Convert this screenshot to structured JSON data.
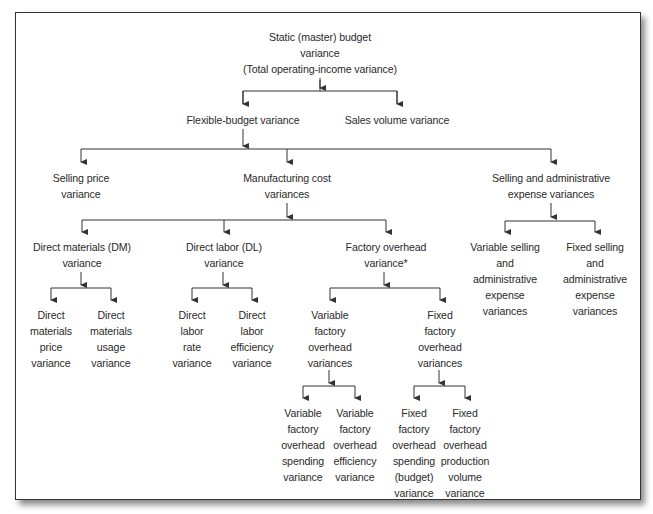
{
  "diagram": {
    "type": "tree",
    "nodes": {
      "root": {
        "lines": [
          "Static (master) budget",
          "variance",
          "(Total operating-income variance)"
        ],
        "x": 320,
        "y": 29
      },
      "flexible": {
        "lines": [
          "Flexible-budget variance"
        ],
        "x": 243,
        "y": 112
      },
      "sales_volume": {
        "lines": [
          "Sales volume variance"
        ],
        "x": 397,
        "y": 112
      },
      "selling_price": {
        "lines": [
          "Selling price",
          "variance"
        ],
        "x": 81,
        "y": 170
      },
      "manufacturing": {
        "lines": [
          "Manufacturing cost",
          "variances"
        ],
        "x": 287,
        "y": 170
      },
      "sga": {
        "lines": [
          "Selling and administrative",
          "expense variances"
        ],
        "x": 551,
        "y": 170
      },
      "dm": {
        "lines": [
          "Direct materials (DM)",
          "variance"
        ],
        "x": 82,
        "y": 239
      },
      "dl": {
        "lines": [
          "Direct labor (DL)",
          "variance"
        ],
        "x": 224,
        "y": 239
      },
      "foh": {
        "lines": [
          "Factory overhead",
          "variance*"
        ],
        "x": 386,
        "y": 239
      },
      "var_sga": {
        "lines": [
          "Variable selling",
          "and",
          "administrative",
          "expense",
          "variances"
        ],
        "x": 505,
        "y": 239
      },
      "fixed_sga": {
        "lines": [
          "Fixed selling",
          "and",
          "administrative",
          "expense",
          "variances"
        ],
        "x": 595,
        "y": 239
      },
      "dm_price": {
        "lines": [
          "Direct",
          "materials",
          "price",
          "variance"
        ],
        "x": 51,
        "y": 307
      },
      "dm_usage": {
        "lines": [
          "Direct",
          "materials",
          "usage",
          "variance"
        ],
        "x": 111,
        "y": 307
      },
      "dl_rate": {
        "lines": [
          "Direct",
          "labor",
          "rate",
          "variance"
        ],
        "x": 192,
        "y": 307
      },
      "dl_eff": {
        "lines": [
          "Direct",
          "labor",
          "efficiency",
          "variance"
        ],
        "x": 252,
        "y": 307
      },
      "vfoh": {
        "lines": [
          "Variable",
          "factory",
          "overhead",
          "variances"
        ],
        "x": 330,
        "y": 307
      },
      "ffoh": {
        "lines": [
          "Fixed",
          "factory",
          "overhead",
          "variances"
        ],
        "x": 440,
        "y": 307
      },
      "vfoh_spend": {
        "lines": [
          "Variable",
          "factory",
          "overhead",
          "spending",
          "variance"
        ],
        "x": 303,
        "y": 405
      },
      "vfoh_eff": {
        "lines": [
          "Variable",
          "factory",
          "overhead",
          "efficiency",
          "variance"
        ],
        "x": 355,
        "y": 405
      },
      "ffoh_spend": {
        "lines": [
          "Fixed",
          "factory",
          "overhead",
          "spending",
          "(budget)",
          "variance"
        ],
        "x": 414,
        "y": 405
      },
      "ffoh_vol": {
        "lines": [
          "Fixed",
          "factory",
          "overhead",
          "production",
          "volume",
          "variance"
        ],
        "x": 465,
        "y": 405
      }
    },
    "edges": [
      [
        "root",
        "flexible"
      ],
      [
        "root",
        "sales_volume"
      ],
      [
        "flexible",
        "selling_price"
      ],
      [
        "flexible",
        "manufacturing"
      ],
      [
        "flexible",
        "sga"
      ],
      [
        "manufacturing",
        "dm"
      ],
      [
        "manufacturing",
        "dl"
      ],
      [
        "manufacturing",
        "foh"
      ],
      [
        "sga",
        "var_sga"
      ],
      [
        "sga",
        "fixed_sga"
      ],
      [
        "dm",
        "dm_price"
      ],
      [
        "dm",
        "dm_usage"
      ],
      [
        "dl",
        "dl_rate"
      ],
      [
        "dl",
        "dl_eff"
      ],
      [
        "foh",
        "vfoh"
      ],
      [
        "foh",
        "ffoh"
      ],
      [
        "vfoh",
        "vfoh_spend"
      ],
      [
        "vfoh",
        "vfoh_eff"
      ],
      [
        "ffoh",
        "ffoh_spend"
      ],
      [
        "ffoh",
        "ffoh_vol"
      ]
    ],
    "colors": {
      "line": "#333333",
      "text": "#2a2a2a",
      "frame": "#333333",
      "background": "#ffffff"
    }
  }
}
